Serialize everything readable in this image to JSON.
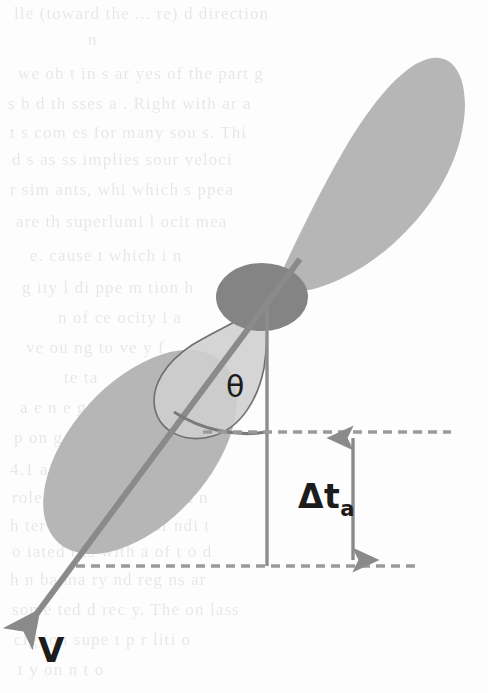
{
  "figure": {
    "caption_title": "Relativistic jet geometry with viewing angle theta",
    "type": "scientific-diagram",
    "background_color": "#fdfdfd",
    "colors": {
      "lobe_fill": "#b6b6b6",
      "core_fill": "#848484",
      "cone_fill": "#cfcfcf",
      "cone_stroke": "#6f6f6f",
      "axis_line": "#8a8a8a",
      "vertical_line": "#8d8d8d",
      "dashed_line": "#9a9a9a",
      "arc_line": "#7a7a7a",
      "measure_arrow": "#8a8a8a",
      "label_text": "#1c1c1c"
    },
    "labels": {
      "theta": "θ",
      "delta_t_main": "Δt",
      "delta_t_sub": "a",
      "velocity": "V"
    },
    "geometry": {
      "core_center_x": 262,
      "core_center_y": 297,
      "core_radius_x": 46,
      "core_radius_y": 34,
      "upper_lobe_angle_deg": -46,
      "lower_lobe_angle_deg": 47,
      "vertical_line_x": 267,
      "vertical_line_top_y": 300,
      "vertical_line_bottom_y": 566,
      "dashed_upper_y": 432,
      "dashed_upper_x1": 203,
      "dashed_upper_x2": 451,
      "dashed_lower_y": 566,
      "dashed_lower_x1": 76,
      "dashed_lower_x2": 421,
      "measure_arrow_x": 353,
      "velocity_arrow_tip_x": 24,
      "velocity_arrow_tip_y": 627,
      "velocity_arrow_tail_x": 298,
      "velocity_arrow_tail_y": 262,
      "theta_arc_radius": 132
    },
    "label_positions": {
      "theta_x": 226,
      "theta_y": 369,
      "delta_t_x": 298,
      "delta_t_y": 477,
      "velocity_x": 38,
      "velocity_y": 630
    },
    "background_text": {
      "description": "faint illegible scanned page text bleeding through from the reverse side",
      "lines": [
        {
          "text": "lle (toward the ... re) d direction",
          "x": 14,
          "y": 4
        },
        {
          "text": "n",
          "x": 88,
          "y": 30
        },
        {
          "text": "we ob t in s ar yes of the part g",
          "x": 18,
          "y": 64
        },
        {
          "text": "s b d th  sses a . Right  with  ar a",
          "x": 8,
          "y": 94
        },
        {
          "text": "t   s com  es for many sou  s. Thi",
          "x": 10,
          "y": 123
        },
        {
          "text": "d   s as  ss implies sour  veloci",
          "x": 12,
          "y": 150
        },
        {
          "text": "r   sim  ants, whi  which s  ppea",
          "x": 10,
          "y": 180
        },
        {
          "text": "are th  superlumi  l ocit mea",
          "x": 16,
          "y": 212
        },
        {
          "text": "e. cause  t  which i  n",
          "x": 30,
          "y": 246
        },
        {
          "text": "g  ity  l di  ppe  m   tion  h",
          "x": 22,
          "y": 278
        },
        {
          "text": "n   of ce ocity i  a",
          "x": 58,
          "y": 308
        },
        {
          "text": "ve  ou  ng  to  ve  y f",
          "x": 26,
          "y": 338
        },
        {
          "text": "te  ta",
          "x": 64,
          "y": 368
        },
        {
          "text": "a e  n e  ge  s t  en t",
          "x": 20,
          "y": 398
        },
        {
          "text": "p  on g  i  e  su   ot",
          "x": 14,
          "y": 428
        },
        {
          "text": "4.1  assumpti  n  nd  rom  o  n",
          "x": 10,
          "y": 460
        },
        {
          "text": "roles  re  made unli  d nd  n",
          "x": 12,
          "y": 488
        },
        {
          "text": "h ter sys  m. ve ry  of  ndi  t",
          "x": 10,
          "y": 516
        },
        {
          "text": "o  iated  t  ts with  a of t  o d",
          "x": 12,
          "y": 542
        },
        {
          "text": "h  n ba  ma  ry  nd  reg  ns  ar",
          "x": 10,
          "y": 570
        },
        {
          "text": "some  ted d  rec  y. The on  lass",
          "x": 12,
          "y": 600
        },
        {
          "text": "cig  ion  supe  t   p r  liti  o",
          "x": 14,
          "y": 630
        },
        {
          "text": "t  y  on  n t  o",
          "x": 18,
          "y": 660
        }
      ]
    }
  }
}
